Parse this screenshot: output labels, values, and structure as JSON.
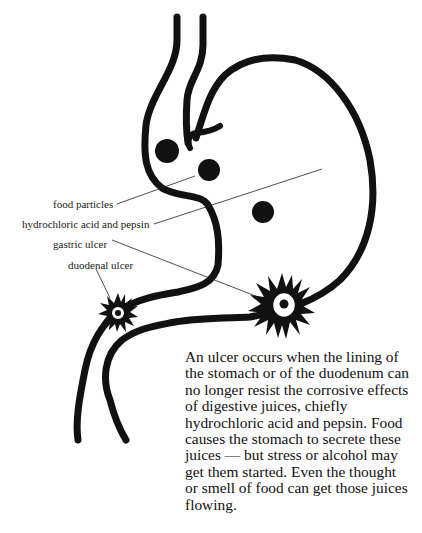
{
  "figure": {
    "labels": {
      "food_particles": "food particles",
      "acid_pepsin": "hydrochloric acid and pepsin",
      "gastric_ulcer": "gastric ulcer",
      "duodenal_ulcer": "duodenal ulcer"
    },
    "caption_lines": [
      "An ulcer occurs when the lining of",
      "the stomach or of the duodenum can",
      "no longer resist the corrosive effects",
      "of digestive juices, chiefly",
      "hydrochloric acid and pepsin. Food",
      "causes the stomach to secrete these",
      "juices — but stress or alcohol may",
      "get them started. Even the thought",
      "or smell of food can get those juices",
      "flowing."
    ],
    "colors": {
      "ink": "#111111",
      "background": "#fefefe"
    }
  }
}
